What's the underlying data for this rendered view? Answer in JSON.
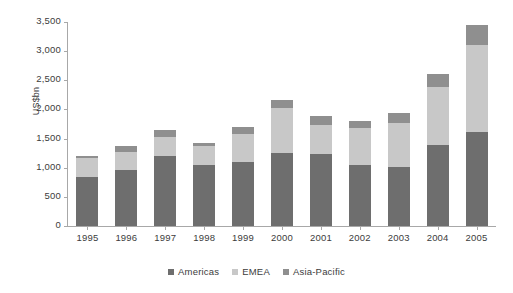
{
  "chart_data": {
    "type": "bar",
    "stacked": true,
    "title": "",
    "xlabel": "",
    "ylabel": "US$bn",
    "ylim": [
      0,
      3500
    ],
    "yticks": [
      0,
      500,
      1000,
      1500,
      2000,
      2500,
      3000,
      3500
    ],
    "ytick_labels": [
      "0",
      "500",
      "1,000",
      "1,500",
      "2,000",
      "2,500",
      "3,000",
      "3,500"
    ],
    "grid": false,
    "legend_position": "bottom",
    "categories": [
      "1995",
      "1996",
      "1997",
      "1998",
      "1999",
      "2000",
      "2001",
      "2002",
      "2003",
      "2004",
      "2005"
    ],
    "series": [
      {
        "name": "Americas",
        "color": "#6e6e6e",
        "values": [
          840,
          960,
          1200,
          1040,
          1090,
          1250,
          1230,
          1050,
          1010,
          1390,
          1620
        ]
      },
      {
        "name": "EMEA",
        "color": "#c8c8c8",
        "values": [
          320,
          310,
          330,
          330,
          490,
          780,
          510,
          640,
          760,
          1000,
          1480
        ]
      },
      {
        "name": "Asia-Pacific",
        "color": "#8f8f8f",
        "values": [
          40,
          100,
          120,
          50,
          120,
          130,
          140,
          120,
          170,
          220,
          350
        ]
      }
    ],
    "totals": [
      1200,
      1370,
      1650,
      1420,
      1700,
      2160,
      1880,
      1810,
      1940,
      2610,
      3450
    ]
  },
  "legend": {
    "items": [
      {
        "label": "Americas"
      },
      {
        "label": "EMEA"
      },
      {
        "label": "Asia-Pacific"
      }
    ]
  }
}
